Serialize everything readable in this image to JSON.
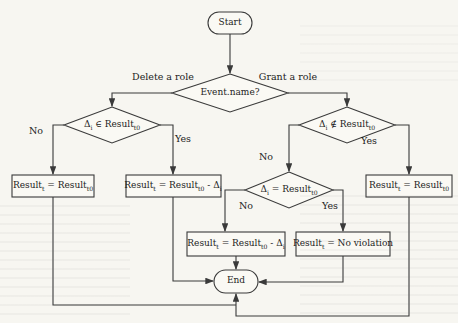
{
  "figure": {
    "background": "#f7f6f1",
    "paper_fill": "#faf9f4",
    "ink": "#3a3a3a"
  },
  "nodes": {
    "start": {
      "label": "Start"
    },
    "event_name": {
      "label": "Event.name?"
    },
    "delta_in_result": {
      "segments": [
        {
          "t": "Δ"
        },
        {
          "s": "i"
        },
        {
          "t": " ∈ Result"
        },
        {
          "s": "t0"
        }
      ]
    },
    "delta_notin_result": {
      "segments": [
        {
          "t": "Δ"
        },
        {
          "s": "i"
        },
        {
          "t": " ∉ Result"
        },
        {
          "s": "t0"
        }
      ]
    },
    "delta_equals_result": {
      "segments": [
        {
          "t": "Δ"
        },
        {
          "s": "i"
        },
        {
          "t": " = Result"
        },
        {
          "s": "t0"
        }
      ]
    },
    "result_unchanged_left": {
      "segments": [
        {
          "t": "Result"
        },
        {
          "s": "t"
        },
        {
          "t": " = Result"
        },
        {
          "s": "t0"
        }
      ]
    },
    "result_minus_delta_left": {
      "segments": [
        {
          "t": "Result"
        },
        {
          "s": "t"
        },
        {
          "t": " = Result"
        },
        {
          "s": "t0"
        },
        {
          "t": " - Δ"
        },
        {
          "s": "i"
        }
      ]
    },
    "result_minus_delta_middle": {
      "segments": [
        {
          "t": "Result"
        },
        {
          "s": "t"
        },
        {
          "t": " = Result"
        },
        {
          "s": "t0"
        },
        {
          "t": " - Δ"
        },
        {
          "s": "i"
        }
      ]
    },
    "result_no_violation": {
      "segments": [
        {
          "t": "Result"
        },
        {
          "s": "t"
        },
        {
          "t": " = No violation"
        }
      ]
    },
    "result_unchanged_right": {
      "segments": [
        {
          "t": "Result"
        },
        {
          "s": "t"
        },
        {
          "t": " = Result"
        },
        {
          "s": "t0"
        }
      ]
    },
    "end": {
      "label": "End"
    }
  },
  "branch_labels": {
    "delete_role": "Delete a role",
    "grant_role": "Grant a role",
    "left_no": "No",
    "left_yes": "Yes",
    "right_no": "No",
    "right_yes": "Yes",
    "middle_no": "No",
    "middle_yes": "Yes"
  }
}
